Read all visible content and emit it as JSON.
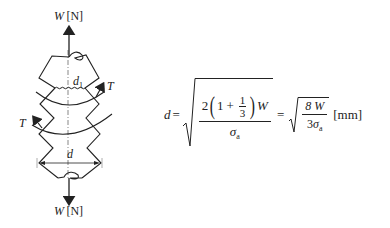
{
  "figure": {
    "top_label": {
      "symbol": "W",
      "unit": "[N]"
    },
    "bottom_label": {
      "symbol": "W",
      "unit": "[N]"
    },
    "inner_diameter_label": {
      "symbol": "d",
      "subscript": "1"
    },
    "outer_diameter_label": "d",
    "torque_label_right": "T",
    "torque_label_left": "T"
  },
  "formula": {
    "lhs": "d",
    "equals": "=",
    "numerator": {
      "coef": "2",
      "one": "1",
      "plus": "+",
      "frac_num": "1",
      "frac_den": "3",
      "var": "W"
    },
    "denominator": {
      "sigma": "σ",
      "sub": "a"
    },
    "equals2": "=",
    "simplified": {
      "num": "8 W",
      "den_coef": "3",
      "sigma": "σ",
      "sub": "a"
    },
    "unit": "[mm]"
  }
}
